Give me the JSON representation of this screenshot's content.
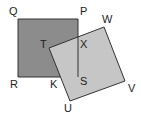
{
  "diagram": {
    "type": "geometry-overlapping-squares",
    "colors": {
      "square_pqrs_fill": "#8c8c8c",
      "square_tuvw_fill": "#c6c6c6",
      "stroke": "#333333",
      "background": "#ffffff"
    },
    "square_pqrs": {
      "label": "PQRS",
      "points": "18,19 78,19 78,77 18,77"
    },
    "square_tuvw": {
      "label": "TUVW",
      "points": "49,48 104,27 125,81 70,101"
    },
    "labels": {
      "Q": "Q",
      "P": "P",
      "W": "W",
      "T": "T",
      "X": "X",
      "R": "R",
      "K": "K",
      "S": "S",
      "V": "V",
      "U": "U"
    }
  }
}
